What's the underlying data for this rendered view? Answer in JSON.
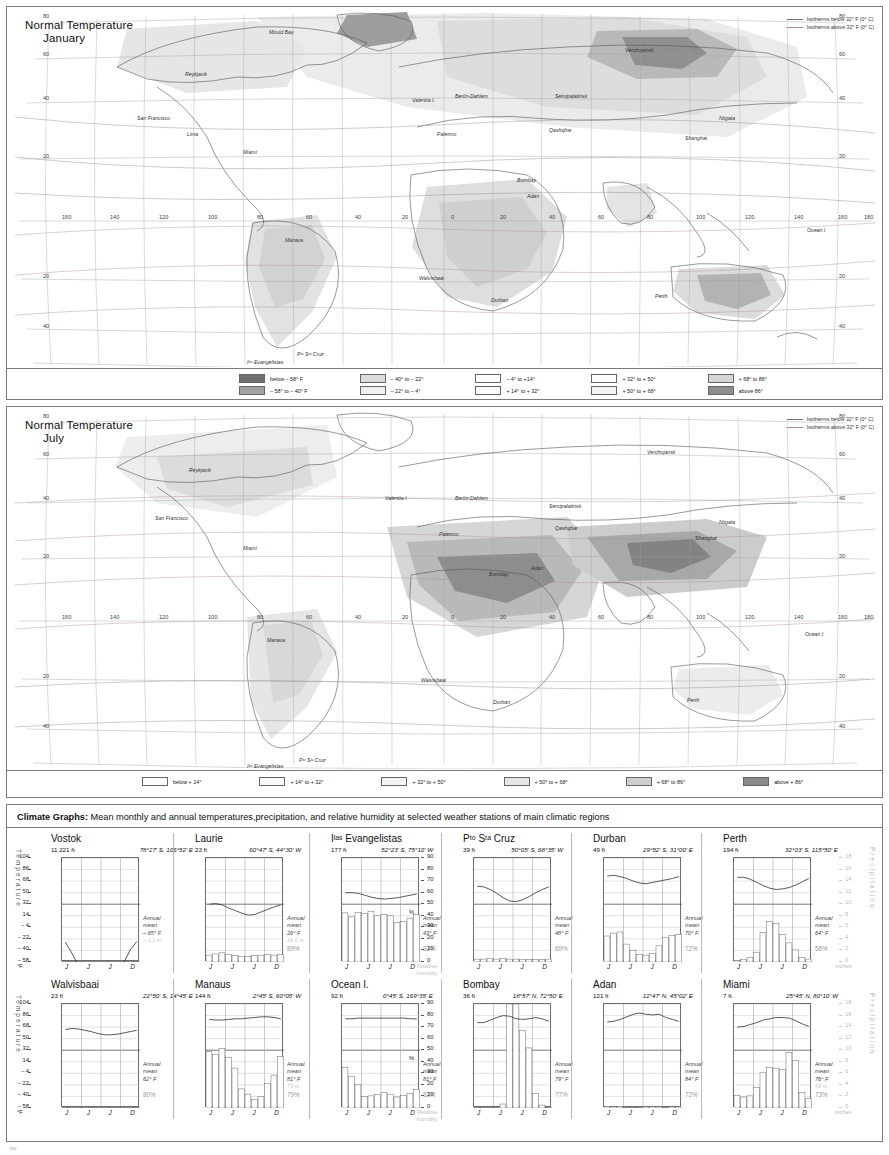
{
  "maps": [
    {
      "id": "january",
      "title_line1": "Normal Temperature",
      "title_line2": "January",
      "isotherm_key": [
        "Isotherms below 32° F (0° C)",
        "Isotherms above 32° F (0° C)"
      ],
      "legend": [
        {
          "color": "#6f6f6f",
          "label": "below – 58° F"
        },
        {
          "color": "#a2a2a2",
          "label": "– 58° to – 40° F"
        },
        {
          "color": "#dcdcdc",
          "label": "– 40° to – 22°"
        },
        {
          "color": "#efefef",
          "label": "– 22° to – 4°"
        },
        {
          "color": "#ffffff",
          "label": "– 4° to +14°"
        },
        {
          "color": "#fbfbfb",
          "label": "+ 14° to + 32°"
        },
        {
          "color": "#ffffff",
          "label": "+ 32° to + 50°"
        },
        {
          "color": "#f5f5f5",
          "label": "+ 50° to + 68°"
        },
        {
          "color": "#d6d6d6",
          "label": "+ 68° to 86°"
        },
        {
          "color": "#8e8e8e",
          "label": "above 86°"
        }
      ],
      "grid_labels": {
        "lat_left": [
          "80",
          "60",
          "40",
          "20",
          "20",
          "40"
        ],
        "lon": [
          "160",
          "140",
          "120",
          "100",
          "80",
          "60",
          "40",
          "20",
          "0",
          "20",
          "40",
          "60",
          "80",
          "100",
          "120",
          "140",
          "160",
          "180"
        ],
        "isotherm_values": [
          "10",
          "20",
          "25",
          "20",
          "25",
          "10"
        ]
      },
      "place_labels": [
        "Mould Bay",
        "Reykjavik",
        "Valentia I.",
        "Berlin-Dahlem",
        "Semipalatinsk",
        "Verchojansk",
        "Qashqhar",
        "Niigata",
        "Shanghai",
        "San Francisco",
        "Lima",
        "Miami",
        "Palermo",
        "Bombay",
        "Adan",
        "Manaus",
        "Walvisbaai",
        "Durban",
        "Perth",
        "Ocean I.",
        "Pᵗᵒ Sᵗᵃ Cruz",
        "Iˡᵃˢ Evangelistas"
      ]
    },
    {
      "id": "july",
      "title_line1": "Normal Temperature",
      "title_line2": "July",
      "isotherm_key": [
        "Isotherms below 32° F (0° C)",
        "Isotherms above 32° F (0° C)"
      ],
      "legend": [
        {
          "color": "#ffffff",
          "label": "below + 14°"
        },
        {
          "color": "#fafafa",
          "label": "+ 14° to + 32°"
        },
        {
          "color": "#f4f4f4",
          "label": "+ 32° to + 50°"
        },
        {
          "color": "#e6e6e6",
          "label": "+ 50° to + 68°"
        },
        {
          "color": "#cfcfcf",
          "label": "+ 68° to 86°"
        },
        {
          "color": "#8a8a8a",
          "label": "above + 86°"
        }
      ],
      "grid_labels": {
        "lat_left": [
          "80",
          "60",
          "40",
          "20",
          "20",
          "40"
        ],
        "lon": [
          "160",
          "140",
          "120",
          "100",
          "80",
          "60",
          "40",
          "20",
          "0",
          "20",
          "40",
          "60",
          "80",
          "100",
          "120",
          "140",
          "160",
          "180"
        ],
        "isotherm_values": [
          "30",
          "25",
          "36",
          "25",
          "25"
        ]
      },
      "place_labels": [
        "Verchojansk",
        "Reykjavik",
        "Valentia I.",
        "Berlin-Dahlem",
        "Semipalatinsk",
        "Qashqhar",
        "Niigata",
        "Shanghai",
        "San Francisco",
        "Miami",
        "Palermo",
        "Adan",
        "Bombay",
        "Manaus",
        "Walvisbaai",
        "Durban",
        "Perth",
        "Ocean I.",
        "Pᵗᵒ Sᵗᵃ Cruz",
        "Iˡᵃˢ Evangelistas"
      ]
    }
  ],
  "climate": {
    "heading_strong": "Climate Graphs:",
    "heading_rest": " Mean monthly and annual temperatures,precipitation, and relative humidity at selected weather stations of main climatic regions",
    "axis_labels": {
      "temperature": "Temperature",
      "precipitation": "Precipitation",
      "inches": "inches",
      "relative_humidity": "Relative\nhumidity",
      "percent": "%",
      "temp_unit": "°F"
    },
    "temp_scale": [
      "104",
      "86",
      "68",
      "50",
      "32",
      "14",
      "– 4",
      "– 22",
      "– 40",
      "– 58"
    ],
    "pct_scale": [
      "90",
      "80",
      "70",
      "60",
      "50",
      "40",
      "30",
      "20",
      "10",
      "0"
    ],
    "precip_scale": [
      "18",
      "16",
      "14",
      "12",
      "10",
      "8",
      "6",
      "4",
      "2",
      "0"
    ],
    "month_labels": [
      "J",
      "J",
      "J",
      "D"
    ],
    "annual_mean_label": "Annual\nmean",
    "page_number": "183",
    "stations": [
      {
        "name": "Vostok",
        "altitude": "11,221 ft",
        "coords": "78°27′ S, 106°52′ E",
        "annual_mean": "– 65° F",
        "annual_precip": "– 1.1 in",
        "humidity": "",
        "temps": [
          -27,
          -44,
          -63,
          -71,
          -71,
          -72,
          -74,
          -76,
          -73,
          -59,
          -39,
          -26
        ],
        "precip": [
          0.05,
          0.05,
          0.05,
          0.1,
          0.1,
          0.1,
          0.1,
          0.1,
          0.1,
          0.1,
          0.05,
          0.05
        ]
      },
      {
        "name": "Laurie",
        "altitude": "23 ft",
        "coords": "60°47′ S, 44°30′ W",
        "annual_mean": "26° F",
        "annual_precip": "16.0 in",
        "humidity": "89%",
        "temps": [
          32,
          33,
          31,
          26,
          22,
          18,
          15,
          16,
          20,
          24,
          28,
          31
        ],
        "precip": [
          1.2,
          1.4,
          1.6,
          1.3,
          1.1,
          1.0,
          1.0,
          1.1,
          1.2,
          1.3,
          1.2,
          1.3
        ]
      },
      {
        "name": "Iˡᵃˢ Evangelistas",
        "altitude": "177 ft",
        "coords": "52°23′ S, 75°10′ W",
        "annual_mean": "43° F",
        "annual_precip": "",
        "humidity": "82%",
        "temps": [
          50,
          50,
          49,
          46,
          43,
          41,
          40,
          41,
          42,
          44,
          46,
          48
        ],
        "precip": [
          8.5,
          7.8,
          8.6,
          8.4,
          8.8,
          8.0,
          8.2,
          8.0,
          6.8,
          7.0,
          7.6,
          8.2
        ]
      },
      {
        "name": "Pᵗᵒ Sᵗᵃ Cruz",
        "altitude": "39 ft",
        "coords": "50°05′ S, 68°35′ W",
        "annual_mean": "48° F",
        "annual_precip": "",
        "humidity": "69%",
        "temps": [
          60,
          59,
          55,
          49,
          42,
          37,
          36,
          39,
          44,
          50,
          55,
          59
        ],
        "precip": [
          0.5,
          0.5,
          0.6,
          0.5,
          0.6,
          0.5,
          0.5,
          0.4,
          0.4,
          0.4,
          0.4,
          0.5
        ]
      },
      {
        "name": "Durban",
        "altitude": "49 ft",
        "coords": "29°52′ S, 31°00′ E",
        "annual_mean": "70° F",
        "annual_precip": "",
        "humidity": "72%",
        "temps": [
          76,
          77,
          75,
          72,
          68,
          65,
          64,
          66,
          68,
          70,
          72,
          75
        ],
        "precip": [
          4.5,
          5.0,
          5.2,
          3.1,
          2.0,
          1.3,
          1.2,
          1.5,
          2.8,
          4.3,
          4.6,
          4.8
        ]
      },
      {
        "name": "Perth",
        "altitude": "194 ft",
        "coords": "32°03′ S, 115°50′ E",
        "annual_mean": "64° F",
        "annual_precip": "",
        "humidity": "56%",
        "temps": [
          74,
          74,
          71,
          66,
          61,
          57,
          55,
          56,
          58,
          62,
          67,
          72
        ],
        "precip": [
          0.3,
          0.4,
          0.8,
          1.7,
          5.1,
          7.0,
          6.7,
          4.8,
          3.3,
          2.1,
          0.8,
          0.5
        ]
      },
      {
        "name": "Walvisbaai",
        "altitude": "23 ft",
        "coords": "22°50′ S, 14°45′ E",
        "annual_mean": "62° F",
        "annual_precip": "",
        "humidity": "80%",
        "temps": [
          64,
          66,
          65,
          63,
          61,
          58,
          56,
          56,
          57,
          59,
          61,
          63
        ],
        "precip": [
          0.05,
          0.1,
          0.1,
          0.05,
          0.05,
          0.05,
          0.05,
          0.05,
          0.05,
          0.05,
          0.05,
          0.05
        ]
      },
      {
        "name": "Manaus",
        "altitude": "144 ft",
        "coords": "2°45′ S, 60°05′ W",
        "annual_mean": "81° F",
        "annual_precip": "73 in",
        "humidity": "79%",
        "temps": [
          80,
          79,
          79,
          80,
          81,
          81,
          82,
          83,
          84,
          84,
          83,
          81
        ],
        "precip": [
          9.8,
          9.3,
          10.3,
          8.7,
          6.9,
          3.3,
          2.4,
          1.5,
          2.0,
          4.3,
          5.7,
          8.9
        ]
      },
      {
        "name": "Ocean I.",
        "altitude": "92 ft",
        "coords": "0°45′ S, 169°35′ E",
        "annual_mean": "81° F",
        "annual_precip": "",
        "humidity": "82%",
        "temps": [
          81,
          81,
          82,
          82,
          82,
          82,
          82,
          82,
          82,
          82,
          81,
          81
        ],
        "precip": [
          7.0,
          5.5,
          4.1,
          2.0,
          2.1,
          2.3,
          2.7,
          2.4,
          1.9,
          2.2,
          2.5,
          3.2
        ]
      },
      {
        "name": "Bombay",
        "altitude": "36 ft",
        "coords": "18°57′ N, 72°50′ E",
        "annual_mean": "79° F",
        "annual_precip": "",
        "humidity": "77%",
        "temps": [
          75,
          75,
          79,
          83,
          86,
          85,
          81,
          80,
          81,
          83,
          81,
          77
        ],
        "precip": [
          0.1,
          0.05,
          0.05,
          0.05,
          0.7,
          19.1,
          24.3,
          13.4,
          10.4,
          2.5,
          0.5,
          0.1
        ]
      },
      {
        "name": "Adan",
        "altitude": "121 ft",
        "coords": "12°47′ N, 45°02′ E",
        "annual_mean": "84° F",
        "annual_precip": "",
        "humidity": "72%",
        "temps": [
          76,
          77,
          80,
          84,
          88,
          90,
          88,
          87,
          88,
          83,
          80,
          77
        ],
        "precip": [
          0.3,
          0.2,
          0.3,
          0.1,
          0.05,
          0.05,
          0.2,
          0.2,
          0.2,
          0.1,
          0.2,
          0.2
        ]
      },
      {
        "name": "Miami",
        "altitude": "7 ft",
        "coords": "25°45′ N, 80°10′ W",
        "annual_mean": "76° F",
        "annual_precip": "59 in",
        "humidity": "73%",
        "temps": [
          68,
          69,
          72,
          75,
          79,
          81,
          83,
          83,
          82,
          78,
          73,
          69
        ],
        "precip": [
          2.2,
          1.9,
          2.1,
          3.6,
          6.1,
          7.0,
          6.9,
          6.7,
          9.6,
          8.2,
          2.7,
          1.6
        ]
      }
    ]
  }
}
